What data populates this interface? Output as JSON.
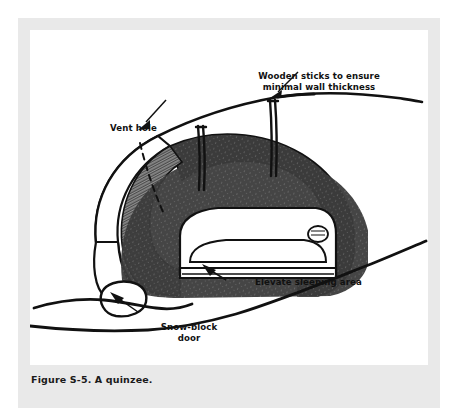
{
  "figure": {
    "caption": "Figure S-5. A quinzee.",
    "style": "black-and-white pen-and-ink line drawing"
  },
  "panel": {
    "mat_color": "#e9e9e9",
    "panel_color": "#ffffff",
    "ink_color": "#111111"
  },
  "callouts": [
    {
      "id": "wooden-sticks",
      "text": "Wooden sticks to ensure\nminimal wall thickness",
      "leader": "arrow pointing down-left to top of right stick"
    },
    {
      "id": "vent-hole",
      "text": "Vent hole",
      "leader": "arrow pointing down-left to dashed vent line"
    },
    {
      "id": "elevate-sleeping-area",
      "text": "Elevate sleeping area",
      "leader": "arrow pointing up-left to raised sleeping platform"
    },
    {
      "id": "snow-block-door",
      "text": "Snow-block\ndoor",
      "leader": "arrow pointing up-left to snow block at entrance"
    }
  ],
  "drawing_elements": [
    {
      "name": "outer-snow-dome-line",
      "description": "thick curved line of piled snow surface"
    },
    {
      "name": "snow-mass-hatched",
      "description": "dark cross-hatched cut face of packed snow"
    },
    {
      "name": "interior-chamber",
      "description": "white hollow sleeping chamber inside the mound"
    },
    {
      "name": "wooden-stick-left",
      "description": "vertical depth-gauge stick"
    },
    {
      "name": "wooden-stick-right",
      "description": "vertical depth-gauge stick"
    },
    {
      "name": "vent-hole-dashed-line",
      "description": "dashed line through wall showing vent shaft"
    },
    {
      "name": "sleeping-person",
      "description": "figure lying on raised sleeping platform"
    },
    {
      "name": "sleeping-platform",
      "description": "elevated snow bench under the sleeper"
    },
    {
      "name": "snow-block-door",
      "description": "rounded snow block beside the entrance"
    },
    {
      "name": "ground-line-upper",
      "description": "snow ground surface through the entrance"
    },
    {
      "name": "ground-line-lower",
      "description": "foreground snow slope rising to the right"
    }
  ]
}
